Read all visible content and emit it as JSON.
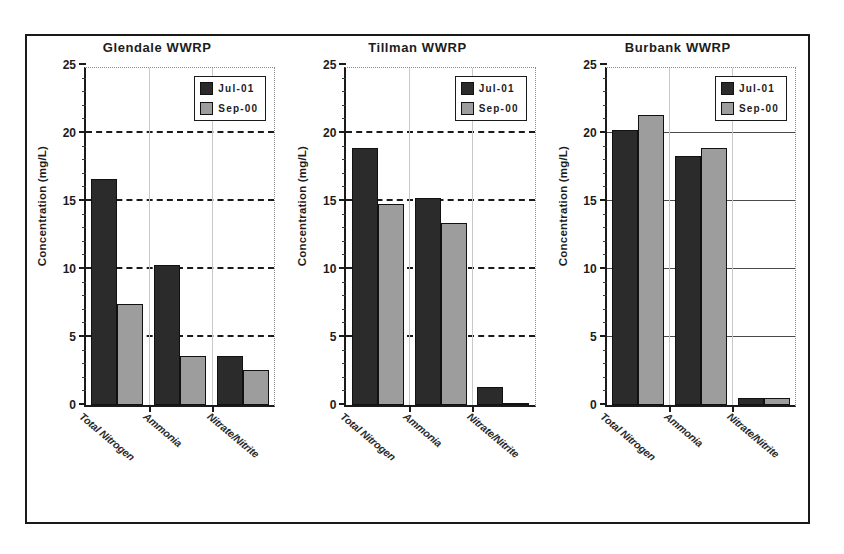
{
  "figure": {
    "panel_count": 3,
    "series_colors": {
      "jul01": "#2b2b2b",
      "sep00": "#9d9d9d"
    },
    "frame_color": "#1a1a1a"
  },
  "chart_data": [
    {
      "type": "bar",
      "title": "Glendale WWRP",
      "xlabel": "",
      "ylabel": "Concentration (mg/L)",
      "categories": [
        "Total Nitrogen",
        "Ammonia",
        "Nitrate/Nitrite"
      ],
      "series": [
        {
          "name": "Jul-01",
          "values": [
            16.6,
            10.3,
            3.6
          ],
          "color": "#2b2b2b"
        },
        {
          "name": "Sep-00",
          "values": [
            7.4,
            3.6,
            2.6
          ],
          "color": "#9d9d9d"
        }
      ],
      "ylim": [
        0,
        25
      ],
      "yticks": [
        0,
        5,
        10,
        15,
        20,
        25
      ],
      "ytick_labels": [
        "0",
        "5",
        "10",
        "15",
        "20",
        "25"
      ],
      "minor_tick_step": 1,
      "grid": "dashed",
      "legend_position": "top-right"
    },
    {
      "type": "bar",
      "title": "Tillman WWRP",
      "xlabel": "",
      "ylabel": "Concentration (mg/L)",
      "categories": [
        "Total Nitrogen",
        "Ammonia",
        "Nitrate/Nitrite"
      ],
      "series": [
        {
          "name": "Jul-01",
          "values": [
            18.9,
            15.2,
            1.3
          ],
          "color": "#2b2b2b"
        },
        {
          "name": "Sep-00",
          "values": [
            14.8,
            13.4,
            0.1
          ],
          "color": "#9d9d9d"
        }
      ],
      "ylim": [
        0,
        25
      ],
      "yticks": [
        0,
        5,
        10,
        15,
        20,
        25
      ],
      "ytick_labels": [
        "0",
        "5",
        "10",
        "15",
        "20",
        "25"
      ],
      "minor_tick_step": 1,
      "grid": "dashed",
      "legend_position": "top-right"
    },
    {
      "type": "bar",
      "title": "Burbank WWRP",
      "xlabel": "",
      "ylabel": "Concentration (mg/L)",
      "categories": [
        "Total Nitrogen",
        "Ammonia",
        "Nitrate/Nitrite"
      ],
      "series": [
        {
          "name": "Jul-01",
          "values": [
            20.2,
            18.3,
            0.5
          ],
          "color": "#2b2b2b"
        },
        {
          "name": "Sep-00",
          "values": [
            21.3,
            18.9,
            0.5
          ],
          "color": "#9d9d9d"
        }
      ],
      "ylim": [
        0,
        25
      ],
      "yticks": [
        0,
        5,
        10,
        15,
        20,
        25
      ],
      "ytick_labels": [
        "0",
        "5",
        "10",
        "15",
        "20",
        "25"
      ],
      "minor_tick_step": 1,
      "grid": "solid",
      "legend_position": "top-right"
    }
  ]
}
